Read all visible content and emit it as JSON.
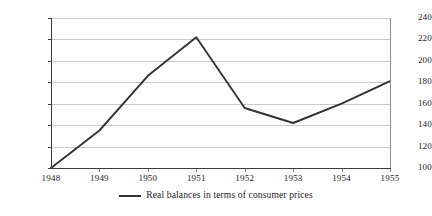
{
  "chart_data": {
    "type": "line",
    "title": "",
    "xlabel": "",
    "ylabel": "",
    "categories": [
      "1948",
      "1949",
      "1950",
      "1951",
      "1952",
      "1953",
      "1954",
      "1955"
    ],
    "x": [
      1948,
      1949,
      1950,
      1951,
      1952,
      1953,
      1954,
      1955
    ],
    "series": [
      {
        "name": "Real balances in terms of consumer prices",
        "values": [
          100,
          135,
          186,
          222,
          156,
          142,
          160,
          181
        ],
        "color": "#333333"
      }
    ],
    "ylim": [
      100,
      240
    ],
    "ytick_labels": [
      "100",
      "120",
      "140",
      "160",
      "180",
      "200",
      "220",
      "240"
    ],
    "ytick_values": [
      100,
      120,
      140,
      160,
      180,
      200,
      220,
      240
    ],
    "xtick_labels": [
      "1948",
      "1949",
      "1950",
      "1951",
      "1952",
      "1953",
      "1954",
      "1955"
    ],
    "grid": true,
    "grid_color": "#c9c9c9",
    "legend_position": "bottom",
    "legend_entries": [
      "Real balances in terms of consumer prices"
    ]
  },
  "legend": {
    "entry_label": "Real balances in terms of consumer prices"
  }
}
